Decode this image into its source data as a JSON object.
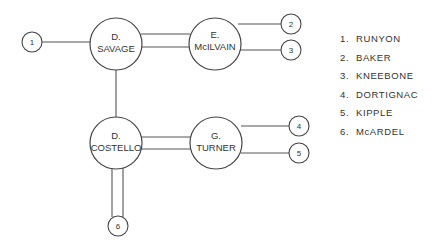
{
  "nodes": {
    "savage": {
      "line1": "D.",
      "line2": "SAVAGE"
    },
    "mcilvain": {
      "line1": "E.",
      "line2": "McILVAIN"
    },
    "costello": {
      "line1": "D.",
      "line2": "COSTELLO"
    },
    "turner": {
      "line1": "G.",
      "line2": "TURNER"
    },
    "n1": "1",
    "n2": "2",
    "n3": "3",
    "n4": "4",
    "n5": "5",
    "n6": "6"
  },
  "legend": [
    {
      "num": "1.",
      "name": "RUNYON"
    },
    {
      "num": "2.",
      "name": "BAKER"
    },
    {
      "num": "3.",
      "name": "KNEEBONE"
    },
    {
      "num": "4.",
      "name": "DORTIGNAC"
    },
    {
      "num": "5.",
      "name": "KIPPLE"
    },
    {
      "num": "6.",
      "name": "McARDEL"
    }
  ]
}
